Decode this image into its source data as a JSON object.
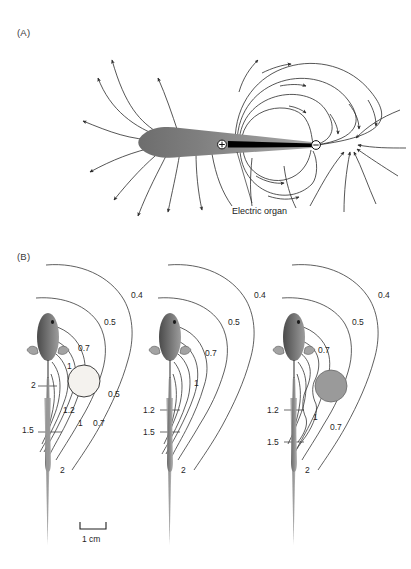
{
  "figure": {
    "panels": [
      {
        "id": "A",
        "label": "(A)",
        "annotation": "Electric organ",
        "electrodes": [
          {
            "name": "positive-terminal",
            "symbol": "+"
          },
          {
            "name": "negative-terminal",
            "symbol": "−"
          }
        ]
      },
      {
        "id": "B",
        "label": "(B)",
        "scale_bar": {
          "text": "1 cm"
        },
        "subpanels": [
          {
            "name": "fish-with-nonconductor",
            "object": {
              "type": "non-conducting",
              "fill": "#f4f2ee"
            },
            "contour_labels": [
              {
                "text": "0.4",
                "x": 131,
                "y": 290
              },
              {
                "text": "0.5",
                "x": 104,
                "y": 317
              },
              {
                "text": "0.7",
                "x": 78,
                "y": 343
              },
              {
                "text": "1",
                "x": 67,
                "y": 361
              },
              {
                "text": "2",
                "x": 31,
                "y": 386
              },
              {
                "text": "0.5",
                "x": 108,
                "y": 392
              },
              {
                "text": "1.2",
                "x": 63,
                "y": 410
              },
              {
                "text": "1",
                "x": 76,
                "y": 425
              },
              {
                "text": "0.7",
                "x": 93,
                "y": 424
              },
              {
                "text": "1.5",
                "x": 27,
                "y": 428
              },
              {
                "text": "2",
                "x": 60,
                "y": 470
              }
            ]
          },
          {
            "name": "fish-without-object",
            "object": null,
            "contour_labels": [
              {
                "text": "0.4",
                "x": 254,
                "y": 290
              },
              {
                "text": "0.5",
                "x": 228,
                "y": 317
              },
              {
                "text": "0.7",
                "x": 205,
                "y": 348
              },
              {
                "text": "1",
                "x": 194,
                "y": 380
              },
              {
                "text": "1.2",
                "x": 148,
                "y": 410
              },
              {
                "text": "1.5",
                "x": 148,
                "y": 428
              },
              {
                "text": "2",
                "x": 181,
                "y": 470
              }
            ]
          },
          {
            "name": "fish-with-conductor",
            "object": {
              "type": "conducting",
              "fill": "#9a9a9a"
            },
            "contour_labels": [
              {
                "text": "0.4",
                "x": 378,
                "y": 290
              },
              {
                "text": "0.5",
                "x": 352,
                "y": 317
              },
              {
                "text": "0.7",
                "x": 320,
                "y": 349
              },
              {
                "text": "1.2",
                "x": 272,
                "y": 410
              },
              {
                "text": "1",
                "x": 320,
                "y": 418
              },
              {
                "text": "0.7",
                "x": 337,
                "y": 428
              },
              {
                "text": "1.5",
                "x": 272,
                "y": 438
              },
              {
                "text": "2",
                "x": 305,
                "y": 470
              }
            ]
          }
        ]
      }
    ]
  },
  "colors": {
    "line": "#2b2b2b",
    "fish_body_dark": "#555555",
    "fish_body_light": "#8d8d8d",
    "conductor": "#9a9a9a",
    "nonconductor": "#f4f2ee",
    "background": "#ffffff"
  }
}
